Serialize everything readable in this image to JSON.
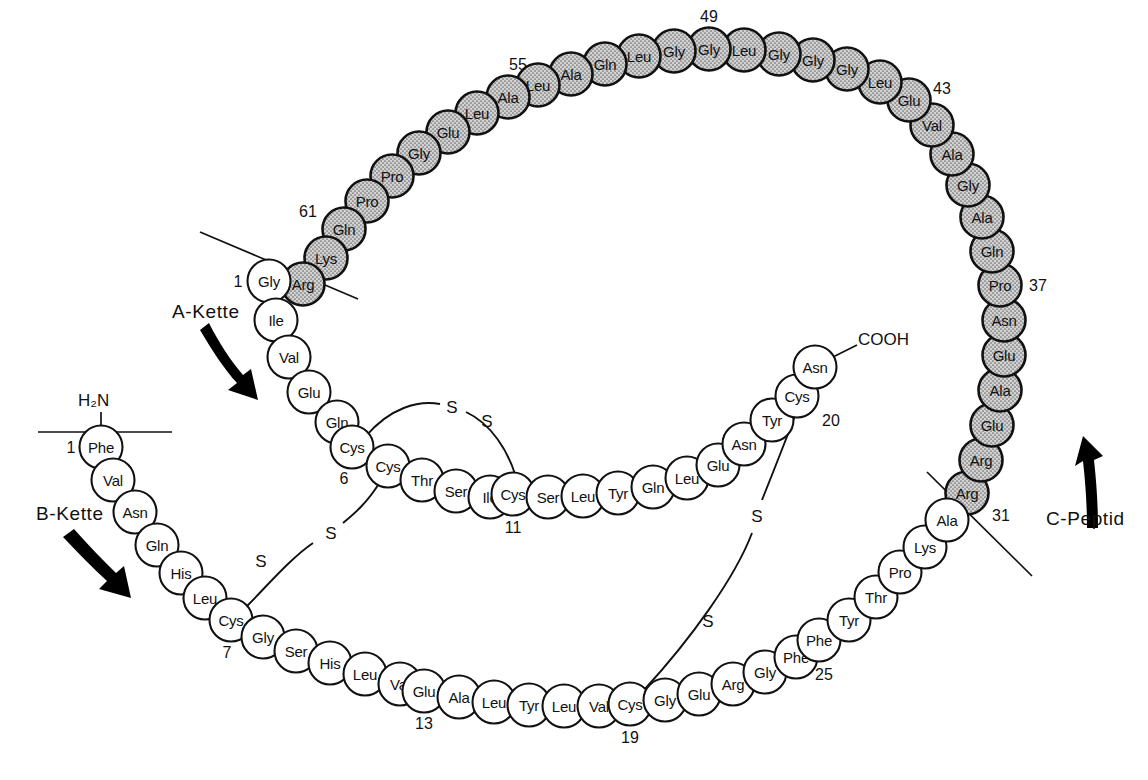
{
  "figure": {
    "colors": {
      "outline": "#111111",
      "white_residue_fill": "#ffffff",
      "shaded_residue_fill": "#c9c9c9",
      "background": "#ffffff"
    }
  },
  "labels": {
    "a_chain": "A-Kette",
    "b_chain": "B-Kette",
    "c_peptide": "C-Peptid",
    "n_terminus": "H₂N",
    "c_terminus": "COOH",
    "sulfur": "S"
  },
  "numbers": {
    "b1": "1",
    "b7": "7",
    "b13": "13",
    "b19": "19",
    "b25": "25",
    "c31": "31",
    "c37": "37",
    "c43": "43",
    "c49": "49",
    "c55": "55",
    "c61": "61",
    "a1": "1",
    "a6": "6",
    "a11": "11",
    "a20": "20"
  },
  "chains": {
    "a_chain": {
      "name": "A-Kette",
      "style": "white",
      "residues": [
        "Gly",
        "Ile",
        "Val",
        "Glu",
        "Gln",
        "Cys",
        "Cys",
        "Thr",
        "Ser",
        "Ile",
        "Cys",
        "Ser",
        "Leu",
        "Tyr",
        "Gln",
        "Leu",
        "Glu",
        "Asn",
        "Tyr",
        "Cys",
        "Asn"
      ],
      "numbered": {
        "1": "Gly",
        "6": "Cys",
        "11": "Cys",
        "20": "Cys"
      }
    },
    "b_chain": {
      "name": "B-Kette",
      "style": "white",
      "residues": [
        "Phe",
        "Val",
        "Asn",
        "Gln",
        "His",
        "Leu",
        "Cys",
        "Gly",
        "Ser",
        "His",
        "Leu",
        "Val",
        "Glu",
        "Ala",
        "Leu",
        "Tyr",
        "Leu",
        "Val",
        "Cys",
        "Gly",
        "Glu",
        "Arg",
        "Gly",
        "Phe",
        "Phe",
        "Tyr",
        "Thr",
        "Pro",
        "Lys",
        "Ala"
      ],
      "numbered": {
        "1": "Phe",
        "7": "Cys",
        "13": "Glu",
        "19": "Cys",
        "25": "Phe"
      }
    },
    "c_peptide": {
      "name": "C-Peptid",
      "style": "shaded",
      "residues": [
        "Arg",
        "Arg",
        "Glu",
        "Ala",
        "Glu",
        "Asn",
        "Pro",
        "Gln",
        "Ala",
        "Gly",
        "Ala",
        "Val",
        "Glu",
        "Leu",
        "Gly",
        "Gly",
        "Gly",
        "Leu",
        "Gly",
        "Gly",
        "Leu",
        "Gln",
        "Ala",
        "Leu",
        "Ala",
        "Leu",
        "Glu",
        "Gly",
        "Pro",
        "Pro",
        "Gln",
        "Lys",
        "Arg"
      ],
      "numbered": {
        "31": "Arg",
        "37": "Pro",
        "43": "Glu",
        "49": "Gly",
        "55": "Ala",
        "61": "Gln"
      }
    }
  },
  "disulfide_bonds": [
    {
      "name": "A6-A11",
      "from": "A6 Cys",
      "to": "A11 Cys",
      "sulfurs": 2
    },
    {
      "name": "A7-B7",
      "from": "A7 Cys",
      "to": "B7 Cys",
      "sulfurs": 2
    },
    {
      "name": "A20-B19",
      "from": "A20 Cys",
      "to": "B19 Cys",
      "sulfurs": 2
    }
  ],
  "cleavage_lines": [
    {
      "name": "a-chain-c-peptide-junction"
    },
    {
      "name": "b-chain-c-peptide-junction"
    }
  ],
  "residue_layout": {
    "a_chain": [
      {
        "label": "Gly",
        "x": 269,
        "y": 281,
        "num": "1",
        "nx": 238,
        "ny": 281
      },
      {
        "label": "Ile",
        "x": 276,
        "y": 320
      },
      {
        "label": "Val",
        "x": 289,
        "y": 357
      },
      {
        "label": "Glu",
        "x": 309,
        "y": 392
      },
      {
        "label": "Gln",
        "x": 337,
        "y": 422
      },
      {
        "label": "Cys",
        "x": 352,
        "y": 447,
        "num": "6",
        "nx": 344,
        "ny": 478
      },
      {
        "label": "Cys",
        "x": 388,
        "y": 466
      },
      {
        "label": "Thr",
        "x": 422,
        "y": 480
      },
      {
        "label": "Ser",
        "x": 456,
        "y": 491
      },
      {
        "label": "Ile",
        "x": 490,
        "y": 497
      },
      {
        "label": "Cys",
        "x": 513,
        "y": 494,
        "num": "11",
        "nx": 513,
        "ny": 527
      },
      {
        "label": "Ser",
        "x": 548,
        "y": 497
      },
      {
        "label": "Leu",
        "x": 583,
        "y": 496
      },
      {
        "label": "Tyr",
        "x": 618,
        "y": 493
      },
      {
        "label": "Gln",
        "x": 653,
        "y": 487
      },
      {
        "label": "Leu",
        "x": 687,
        "y": 478
      },
      {
        "label": "Glu",
        "x": 718,
        "y": 465
      },
      {
        "label": "Asn",
        "x": 744,
        "y": 444
      },
      {
        "label": "Tyr",
        "x": 772,
        "y": 420
      },
      {
        "label": "Cys",
        "x": 797,
        "y": 396,
        "num": "20",
        "nx": 831,
        "ny": 420
      },
      {
        "label": "Asn",
        "x": 815,
        "y": 367
      }
    ],
    "b_chain": [
      {
        "label": "Phe",
        "x": 101,
        "y": 447,
        "num": "1",
        "nx": 71,
        "ny": 447
      },
      {
        "label": "Val",
        "x": 113,
        "y": 480
      },
      {
        "label": "Asn",
        "x": 135,
        "y": 512
      },
      {
        "label": "Gln",
        "x": 157,
        "y": 545
      },
      {
        "label": "His",
        "x": 181,
        "y": 573
      },
      {
        "label": "Leu",
        "x": 205,
        "y": 598
      },
      {
        "label": "Cys",
        "x": 231,
        "y": 620,
        "num": "7",
        "nx": 227,
        "ny": 652
      },
      {
        "label": "Gly",
        "x": 263,
        "y": 637
      },
      {
        "label": "Ser",
        "x": 296,
        "y": 651
      },
      {
        "label": "His",
        "x": 330,
        "y": 663
      },
      {
        "label": "Leu",
        "x": 365,
        "y": 674
      },
      {
        "label": "Val",
        "x": 400,
        "y": 684
      },
      {
        "label": "Glu",
        "x": 424,
        "y": 691,
        "num": "13",
        "nx": 424,
        "ny": 723
      },
      {
        "label": "Ala",
        "x": 459,
        "y": 697
      },
      {
        "label": "Leu",
        "x": 494,
        "y": 702
      },
      {
        "label": "Tyr",
        "x": 529,
        "y": 705
      },
      {
        "label": "Leu",
        "x": 564,
        "y": 706
      },
      {
        "label": "Val",
        "x": 599,
        "y": 706
      },
      {
        "label": "Cys",
        "x": 630,
        "y": 704,
        "num": "19",
        "nx": 630,
        "ny": 737
      },
      {
        "label": "Gly",
        "x": 665,
        "y": 700
      },
      {
        "label": "Glu",
        "x": 699,
        "y": 694
      },
      {
        "label": "Arg",
        "x": 733,
        "y": 684
      },
      {
        "label": "Gly",
        "x": 765,
        "y": 672
      },
      {
        "label": "Phe",
        "x": 796,
        "y": 657
      },
      {
        "label": "Phe",
        "x": 819,
        "y": 640,
        "num": "25",
        "nx": 824,
        "ny": 674
      },
      {
        "label": "Tyr",
        "x": 849,
        "y": 620
      },
      {
        "label": "Thr",
        "x": 876,
        "y": 597
      },
      {
        "label": "Pro",
        "x": 900,
        "y": 572
      },
      {
        "label": "Lys",
        "x": 925,
        "y": 547
      },
      {
        "label": "Ala",
        "x": 947,
        "y": 520
      }
    ],
    "c_peptide": [
      {
        "label": "Arg",
        "x": 967,
        "y": 493,
        "num": "31",
        "nx": 1001,
        "ny": 515
      },
      {
        "label": "Arg",
        "x": 981,
        "y": 460
      },
      {
        "label": "Glu",
        "x": 992,
        "y": 425
      },
      {
        "label": "Ala",
        "x": 1000,
        "y": 390
      },
      {
        "label": "Glu",
        "x": 1004,
        "y": 355
      },
      {
        "label": "Asn",
        "x": 1004,
        "y": 320
      },
      {
        "label": "Pro",
        "x": 1000,
        "y": 285,
        "num": "37",
        "nx": 1038,
        "ny": 285
      },
      {
        "label": "Gln",
        "x": 992,
        "y": 251
      },
      {
        "label": "Ala",
        "x": 982,
        "y": 217
      },
      {
        "label": "Gly",
        "x": 968,
        "y": 185
      },
      {
        "label": "Ala",
        "x": 952,
        "y": 154
      },
      {
        "label": "Val",
        "x": 932,
        "y": 125
      },
      {
        "label": "Glu",
        "x": 909,
        "y": 100,
        "num": "43",
        "nx": 942,
        "ny": 88
      },
      {
        "label": "Leu",
        "x": 880,
        "y": 82
      },
      {
        "label": "Gly",
        "x": 847,
        "y": 69
      },
      {
        "label": "Gly",
        "x": 813,
        "y": 60
      },
      {
        "label": "Gly",
        "x": 779,
        "y": 54
      },
      {
        "label": "Leu",
        "x": 744,
        "y": 50
      },
      {
        "label": "Gly",
        "x": 709,
        "y": 49,
        "num": "49",
        "nx": 709,
        "ny": 16
      },
      {
        "label": "Gly",
        "x": 674,
        "y": 51
      },
      {
        "label": "Leu",
        "x": 639,
        "y": 56
      },
      {
        "label": "Gln",
        "x": 605,
        "y": 64
      },
      {
        "label": "Ala",
        "x": 571,
        "y": 74
      },
      {
        "label": "Leu",
        "x": 538,
        "y": 85
      },
      {
        "label": "Ala",
        "x": 508,
        "y": 97,
        "num": "55",
        "nx": 518,
        "ny": 64
      },
      {
        "label": "Leu",
        "x": 477,
        "y": 113
      },
      {
        "label": "Glu",
        "x": 448,
        "y": 132
      },
      {
        "label": "Gly",
        "x": 419,
        "y": 153
      },
      {
        "label": "Pro",
        "x": 392,
        "y": 176
      },
      {
        "label": "Pro",
        "x": 367,
        "y": 201
      },
      {
        "label": "Gln",
        "x": 344,
        "y": 229,
        "num": "61",
        "nx": 308,
        "ny": 211
      },
      {
        "label": "Lys",
        "x": 326,
        "y": 258
      },
      {
        "label": "Arg",
        "x": 303,
        "y": 284
      }
    ]
  }
}
